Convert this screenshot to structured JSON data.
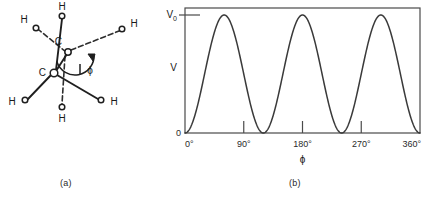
{
  "figure": {
    "caption_a": "(a)",
    "caption_b": "(b)"
  },
  "molecule": {
    "title": "ethane-newman-projection",
    "front_carbon_label": "C",
    "rear_carbon_label": "C",
    "dihedral_label": "ϕ",
    "hydrogen_labels": {
      "front_top": "H",
      "front_lower_left": "H",
      "front_lower_right": "H",
      "rear_upper_left": "H",
      "rear_upper_right": "H",
      "rear_bottom": "H"
    },
    "atoms": [
      {
        "name": "rear-carbon",
        "label": "C",
        "cx": 68,
        "cy": 52,
        "lx": 62,
        "ly": 44,
        "r": 3.2
      },
      {
        "name": "front-carbon",
        "label": "C",
        "cx": 54,
        "cy": 73,
        "lx": 42,
        "ly": 73,
        "r": 3.6
      },
      {
        "name": "h-front-top",
        "label": "H",
        "cx": 62,
        "cy": 16,
        "lx": 62,
        "ly": 9,
        "r": 2.8
      },
      {
        "name": "h-front-lower-left",
        "label": "H",
        "cx": 25,
        "cy": 100,
        "lx": 13,
        "ly": 104,
        "r": 2.8
      },
      {
        "name": "h-front-lower-right",
        "label": "H",
        "cx": 101,
        "cy": 100,
        "lx": 113,
        "ly": 104,
        "r": 2.8
      },
      {
        "name": "h-rear-upper-left",
        "label": "H",
        "cx": 36,
        "cy": 28,
        "lx": 25,
        "ly": 21,
        "r": 2.8
      },
      {
        "name": "h-rear-upper-right",
        "label": "H",
        "cx": 122,
        "cy": 29,
        "lx": 134,
        "ly": 25,
        "r": 2.8
      },
      {
        "name": "h-rear-bottom",
        "label": "H",
        "cx": 62,
        "cy": 107,
        "lx": 62,
        "ly": 120,
        "r": 2.8
      }
    ]
  },
  "chart_data": {
    "type": "line",
    "title": "",
    "xlabel": "ϕ",
    "ylabel": "V",
    "xlim": [
      0,
      360
    ],
    "ylim": [
      0,
      1
    ],
    "grid": false,
    "legend": null,
    "x_ticks": [
      0,
      90,
      180,
      270,
      360
    ],
    "x_tick_labels": [
      "0°",
      "90°",
      "180°",
      "270°",
      "360°"
    ],
    "y_ticks": [
      0,
      1
    ],
    "y_tick_labels": [
      "0",
      "V₀"
    ],
    "y_axis_symbol": "V",
    "y_max_symbol": "V₀",
    "y_max_symbol_base": "V",
    "y_max_symbol_sub": "0",
    "y_min_label": "0",
    "period_degrees": 120,
    "maxima_degrees": [
      60,
      180,
      300
    ],
    "minima_degrees": [
      0,
      120,
      240,
      360
    ],
    "x": [
      0,
      10,
      20,
      30,
      40,
      50,
      60,
      70,
      80,
      90,
      100,
      110,
      120,
      130,
      140,
      150,
      160,
      170,
      180,
      190,
      200,
      210,
      220,
      230,
      240,
      250,
      260,
      270,
      280,
      290,
      300,
      310,
      320,
      330,
      340,
      350,
      360
    ],
    "y": [
      0.0,
      0.066,
      0.25,
      0.5,
      0.75,
      0.933,
      1.0,
      0.933,
      0.75,
      0.5,
      0.25,
      0.066,
      0.0,
      0.066,
      0.25,
      0.5,
      0.75,
      0.933,
      1.0,
      0.933,
      0.75,
      0.5,
      0.25,
      0.066,
      0.0,
      0.066,
      0.25,
      0.5,
      0.75,
      0.933,
      1.0,
      0.933,
      0.75,
      0.5,
      0.25,
      0.066,
      0.0
    ]
  },
  "colors": {
    "line": "#3a3a3a",
    "frame": "#4a4a4a",
    "text": "#1a1a1a",
    "background": "#ffffff"
  }
}
